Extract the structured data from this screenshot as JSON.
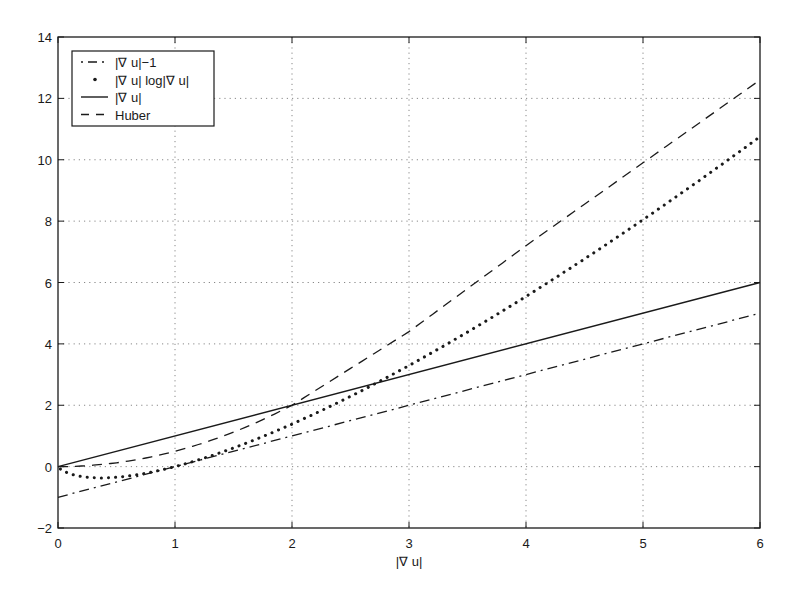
{
  "chart_data": {
    "type": "line",
    "title": "",
    "xlabel": "|∇ u|",
    "ylabel": "",
    "xlim": [
      0,
      6
    ],
    "ylim": [
      -2,
      14
    ],
    "grid": true,
    "legend_position": "upper-left",
    "x_ticks": [
      "0",
      "1",
      "2",
      "3",
      "4",
      "5",
      "6"
    ],
    "y_ticks": [
      "-2",
      "0",
      "2",
      "4",
      "6",
      "8",
      "10",
      "12",
      "14"
    ],
    "series": [
      {
        "name": "|∇ u|−1",
        "style": "dashdot",
        "x": [
          0,
          6
        ],
        "y": [
          -1,
          5
        ]
      },
      {
        "name": "|∇ u| log|∇ u|",
        "style": "dotted",
        "x": [
          0.02,
          0.1,
          0.2,
          0.3,
          0.37,
          0.5,
          0.7,
          1,
          1.5,
          2,
          2.5,
          3,
          3.5,
          4,
          4.5,
          5,
          5.5,
          6
        ],
        "y": [
          -0.08,
          -0.23,
          -0.32,
          -0.36,
          -0.37,
          -0.35,
          -0.25,
          0,
          0.61,
          1.39,
          2.29,
          3.3,
          4.38,
          5.55,
          6.77,
          8.05,
          9.38,
          10.75
        ]
      },
      {
        "name": "|∇ u|",
        "style": "solid",
        "x": [
          0,
          6
        ],
        "y": [
          0,
          6
        ]
      },
      {
        "name": "Huber",
        "style": "dashed",
        "x": [
          0,
          0.5,
          1,
          1.5,
          2,
          3,
          4,
          5,
          6
        ],
        "y": [
          0,
          0.125,
          0.5,
          1.125,
          2,
          4.4,
          7.2,
          9.9,
          12.6
        ]
      }
    ]
  }
}
